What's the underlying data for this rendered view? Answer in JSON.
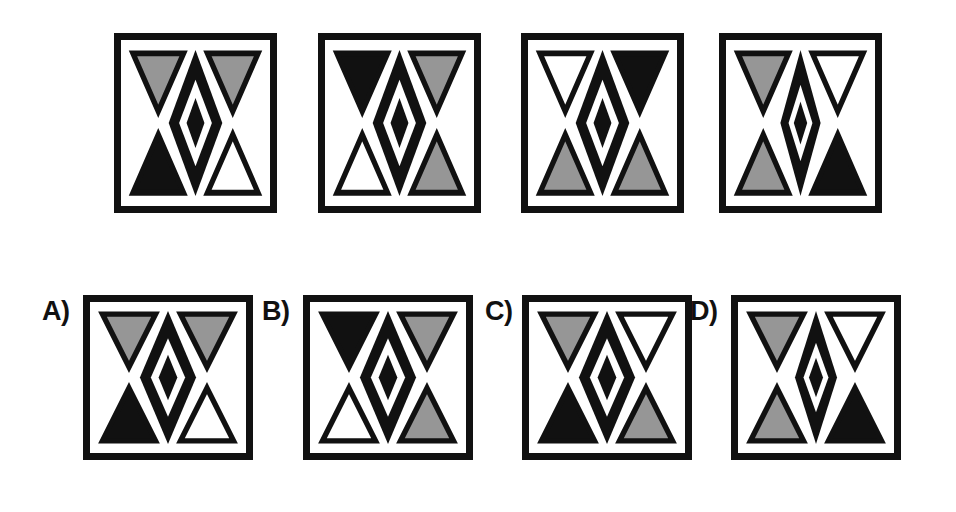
{
  "puzzle": {
    "type": "visual-analogy-matrix",
    "background_color": "#ffffff",
    "palette": {
      "black": "#111111",
      "gray": "#969696",
      "white": "#ffffff",
      "outline": "#111111"
    },
    "stimulus_row": {
      "name": "stimulus-row",
      "panels": [
        {
          "id": "stimulus-1",
          "label": "",
          "x": 114,
          "y": 33,
          "w": 163,
          "h": 180,
          "triangles": {
            "top_left": "gray",
            "top_right": "gray",
            "bottom_left": "black",
            "bottom_right": "white"
          },
          "center": {
            "outer_diamond": "black",
            "inner_diamond": "white",
            "core_diamond": "black",
            "width": "wide"
          }
        },
        {
          "id": "stimulus-2",
          "label": "",
          "x": 318,
          "y": 33,
          "w": 163,
          "h": 180,
          "triangles": {
            "top_left": "black",
            "top_right": "gray",
            "bottom_left": "white",
            "bottom_right": "gray"
          },
          "center": {
            "outer_diamond": "black",
            "inner_diamond": "white",
            "core_diamond": "black",
            "width": "wide"
          }
        },
        {
          "id": "stimulus-3",
          "label": "",
          "x": 521,
          "y": 33,
          "w": 163,
          "h": 180,
          "triangles": {
            "top_left": "white",
            "top_right": "black",
            "bottom_left": "gray",
            "bottom_right": "gray"
          },
          "center": {
            "outer_diamond": "black",
            "inner_diamond": "white",
            "core_diamond": "black",
            "width": "wide"
          }
        },
        {
          "id": "stimulus-4",
          "label": "",
          "x": 719,
          "y": 33,
          "w": 163,
          "h": 180,
          "triangles": {
            "top_left": "gray",
            "top_right": "white",
            "bottom_left": "gray",
            "bottom_right": "black"
          },
          "center": {
            "outer_diamond": "black",
            "inner_diamond": "white",
            "core_diamond": "black",
            "width": "narrow"
          }
        }
      ]
    },
    "answer_row": {
      "name": "answer-options-row",
      "options": [
        {
          "id": "option-a",
          "label": "A)",
          "label_x": 42,
          "label_y": 298,
          "x": 83,
          "y": 295,
          "w": 170,
          "h": 165,
          "triangles": {
            "top_left": "gray",
            "top_right": "gray",
            "bottom_left": "black",
            "bottom_right": "white"
          },
          "center": {
            "outer_diamond": "black",
            "inner_diamond": "white",
            "core_diamond": "black",
            "width": "wide"
          }
        },
        {
          "id": "option-b",
          "label": "B)",
          "label_x": 262,
          "label_y": 298,
          "x": 303,
          "y": 295,
          "w": 170,
          "h": 165,
          "triangles": {
            "top_left": "black",
            "top_right": "gray",
            "bottom_left": "white",
            "bottom_right": "gray"
          },
          "center": {
            "outer_diamond": "black",
            "inner_diamond": "white",
            "core_diamond": "black",
            "width": "wide"
          }
        },
        {
          "id": "option-c",
          "label": "C)",
          "label_x": 485,
          "label_y": 298,
          "x": 522,
          "y": 295,
          "w": 170,
          "h": 165,
          "triangles": {
            "top_left": "gray",
            "top_right": "white",
            "bottom_left": "black",
            "bottom_right": "gray"
          },
          "center": {
            "outer_diamond": "black",
            "inner_diamond": "white",
            "core_diamond": "black",
            "width": "wide"
          }
        },
        {
          "id": "option-d",
          "label": "D)",
          "label_x": 690,
          "label_y": 298,
          "x": 731,
          "y": 295,
          "w": 170,
          "h": 165,
          "triangles": {
            "top_left": "gray",
            "top_right": "white",
            "bottom_left": "gray",
            "bottom_right": "black"
          },
          "center": {
            "outer_diamond": "black",
            "inner_diamond": "white",
            "core_diamond": "black",
            "width": "narrow"
          }
        }
      ]
    }
  }
}
